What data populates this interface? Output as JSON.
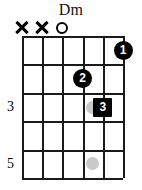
{
  "chord": {
    "name": "Dm",
    "instrument": "guitar",
    "string_count": 6,
    "fret_rows": 5,
    "colors": {
      "grid": "#1a1a1a",
      "marker_fill": "#000000",
      "marker_text": "#ffffff",
      "inlay_dot": "#c9c9c9",
      "background": "#ffffff"
    },
    "open_mute_markers": [
      {
        "string": 1,
        "symbol": "X",
        "icon": "mute-x-icon",
        "meaning": "muted"
      },
      {
        "string": 2,
        "symbol": "X",
        "icon": "mute-x-icon",
        "meaning": "muted"
      },
      {
        "string": 3,
        "symbol": "O",
        "icon": "open-circle-icon",
        "meaning": "open"
      },
      {
        "string": 4,
        "symbol": "",
        "icon": "",
        "meaning": ""
      },
      {
        "string": 5,
        "symbol": "",
        "icon": "",
        "meaning": ""
      },
      {
        "string": 6,
        "symbol": "",
        "icon": "",
        "meaning": ""
      }
    ],
    "fret_labels": [
      {
        "fret": 3,
        "label": "3",
        "row_index": 2
      },
      {
        "fret": 5,
        "label": "5",
        "row_index": 4
      }
    ],
    "inlay_dots": [
      {
        "row_index": 2,
        "string": 4
      },
      {
        "row_index": 4,
        "string": 4
      }
    ],
    "finger_positions": [
      {
        "finger": "1",
        "string": 6,
        "row_index": 0,
        "shape": "circle"
      },
      {
        "finger": "2",
        "string": 4,
        "row_index": 1,
        "shape": "circle"
      },
      {
        "finger": "3",
        "string": 5,
        "row_index": 2,
        "shape": "square"
      }
    ]
  }
}
